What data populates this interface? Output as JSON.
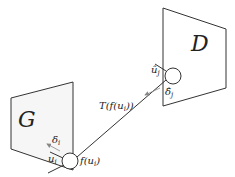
{
  "diagram": {
    "planes": [
      {
        "id": "G",
        "label": "G",
        "points": "11,98 73,82 73,170 11,149"
      },
      {
        "id": "D",
        "label": "D",
        "points": "163,8 226,29 226,88 163,106"
      }
    ],
    "nodes": [
      {
        "id": "node-i",
        "cx": 70,
        "cy": 161,
        "r": 8
      },
      {
        "id": "node-j",
        "cx": 173,
        "cy": 76,
        "r": 8
      }
    ],
    "edge": {
      "label": "T(f(u_i))",
      "display": "T(f(uᵢ))"
    },
    "labels": {
      "G": "G",
      "D": "D",
      "delta_i": "δ",
      "delta_i_sub": "i",
      "u_i": "u",
      "u_i_sub": "i",
      "f_u_i": "f(u",
      "f_u_i_sub": "i",
      "f_u_i_close": ")",
      "T_label": "T(f(u",
      "T_label_sub": "i",
      "T_label_close": "))",
      "uhat_j": "û",
      "uhat_j_sub": "j",
      "deltahat_j": "δ̂",
      "deltahat_j_sub": "j"
    },
    "colors": {
      "plane_fill": "#f6f6f6",
      "stroke": "#333333",
      "arrow": "#888888"
    }
  }
}
